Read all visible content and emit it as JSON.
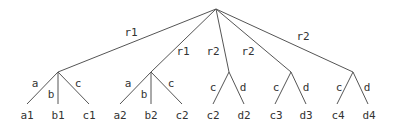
{
  "diagram": {
    "type": "tree",
    "root": {
      "x": 216,
      "y": 9
    },
    "internal_nodes": [
      {
        "id": "n1",
        "x": 58,
        "y": 72,
        "edge_label": "r1",
        "edge_label_pos": {
          "x": 131,
          "y": 33
        }
      },
      {
        "id": "n2",
        "x": 151,
        "y": 72,
        "edge_label": "r1",
        "edge_label_pos": {
          "x": 183,
          "y": 52
        }
      },
      {
        "id": "n3",
        "x": 229,
        "y": 72,
        "edge_label": "r2",
        "edge_label_pos": {
          "x": 213,
          "y": 52
        }
      },
      {
        "id": "n4",
        "x": 291,
        "y": 72,
        "edge_label": "r2",
        "edge_label_pos": {
          "x": 248,
          "y": 52
        }
      },
      {
        "id": "n5",
        "x": 353,
        "y": 72,
        "edge_label": "r2",
        "edge_label_pos": {
          "x": 303,
          "y": 37
        }
      }
    ],
    "leaves": [
      {
        "parent": "n1",
        "x": 27,
        "y": 104,
        "edge_label": "a",
        "edge_label_pos": {
          "x": 35,
          "y": 84
        },
        "label": "a1",
        "label_pos": {
          "x": 27,
          "y": 116
        }
      },
      {
        "parent": "n1",
        "x": 58,
        "y": 104,
        "edge_label": "b",
        "edge_label_pos": {
          "x": 51,
          "y": 95
        },
        "label": "b1",
        "label_pos": {
          "x": 58,
          "y": 116
        }
      },
      {
        "parent": "n1",
        "x": 89,
        "y": 104,
        "edge_label": "c",
        "edge_label_pos": {
          "x": 78,
          "y": 84
        },
        "label": "c1",
        "label_pos": {
          "x": 89,
          "y": 116
        }
      },
      {
        "parent": "n2",
        "x": 120,
        "y": 104,
        "edge_label": "a",
        "edge_label_pos": {
          "x": 128,
          "y": 84
        },
        "label": "a2",
        "label_pos": {
          "x": 120,
          "y": 116
        }
      },
      {
        "parent": "n2",
        "x": 151,
        "y": 104,
        "edge_label": "b",
        "edge_label_pos": {
          "x": 144,
          "y": 95
        },
        "label": "b2",
        "label_pos": {
          "x": 151,
          "y": 116
        }
      },
      {
        "parent": "n2",
        "x": 182,
        "y": 104,
        "edge_label": "c",
        "edge_label_pos": {
          "x": 171,
          "y": 84
        },
        "label": "c2",
        "label_pos": {
          "x": 182,
          "y": 116
        }
      },
      {
        "parent": "n3",
        "x": 213,
        "y": 104,
        "edge_label": "c",
        "edge_label_pos": {
          "x": 213,
          "y": 88
        },
        "label": "c2",
        "label_pos": {
          "x": 213,
          "y": 116
        }
      },
      {
        "parent": "n3",
        "x": 244,
        "y": 104,
        "edge_label": "d",
        "edge_label_pos": {
          "x": 243,
          "y": 88
        },
        "label": "d2",
        "label_pos": {
          "x": 244,
          "y": 116
        }
      },
      {
        "parent": "n4",
        "x": 275,
        "y": 104,
        "edge_label": "c",
        "edge_label_pos": {
          "x": 276,
          "y": 88
        },
        "label": "c3",
        "label_pos": {
          "x": 276,
          "y": 116
        }
      },
      {
        "parent": "n4",
        "x": 306,
        "y": 104,
        "edge_label": "d",
        "edge_label_pos": {
          "x": 306,
          "y": 88
        },
        "label": "d3",
        "label_pos": {
          "x": 306,
          "y": 116
        }
      },
      {
        "parent": "n5",
        "x": 337,
        "y": 104,
        "edge_label": "c",
        "edge_label_pos": {
          "x": 339,
          "y": 88
        },
        "label": "c4",
        "label_pos": {
          "x": 338,
          "y": 116
        }
      },
      {
        "parent": "n5",
        "x": 368,
        "y": 104,
        "edge_label": "d",
        "edge_label_pos": {
          "x": 367,
          "y": 88
        },
        "label": "d4",
        "label_pos": {
          "x": 369,
          "y": 116
        }
      }
    ]
  }
}
